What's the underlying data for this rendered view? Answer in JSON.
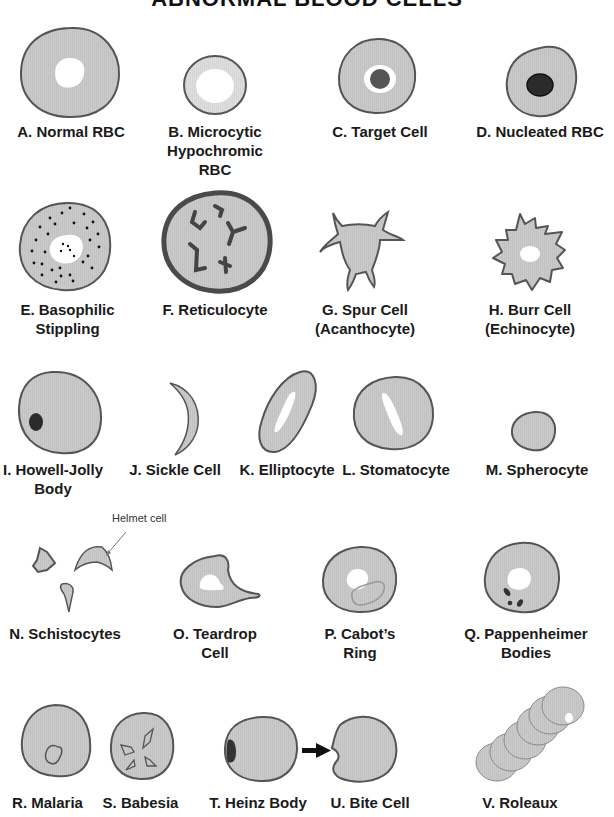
{
  "title": "ABNORMAL BLOOD CELLS",
  "colors": {
    "cell_fill": "#c9c9c9",
    "cell_outline": "#555555",
    "pale_center": "#ffffff",
    "inclusion_dark": "#333333",
    "microcytic_fill": "#dcdcdc",
    "reticulocyte_outline": "#4a4a4a"
  },
  "cells": [
    {
      "id": "A",
      "label_lines": [
        "A. Normal RBC"
      ]
    },
    {
      "id": "B",
      "label_lines": [
        "B. Microcytic",
        "Hypochromic",
        "RBC"
      ]
    },
    {
      "id": "C",
      "label_lines": [
        "C. Target Cell"
      ]
    },
    {
      "id": "D",
      "label_lines": [
        "D. Nucleated RBC"
      ]
    },
    {
      "id": "E",
      "label_lines": [
        "E. Basophilic",
        "Stippling"
      ]
    },
    {
      "id": "F",
      "label_lines": [
        "F. Reticulocyte"
      ]
    },
    {
      "id": "G",
      "label_lines": [
        "G. Spur Cell",
        "(Acanthocyte)"
      ]
    },
    {
      "id": "H",
      "label_lines": [
        "H. Burr Cell",
        "(Echinocyte)"
      ]
    },
    {
      "id": "I",
      "label_lines": [
        "I. Howell-Jolly",
        "Body"
      ]
    },
    {
      "id": "J",
      "label_lines": [
        "J. Sickle Cell"
      ]
    },
    {
      "id": "K",
      "label_lines": [
        "K. Elliptocyte"
      ]
    },
    {
      "id": "L",
      "label_lines": [
        "L. Stomatocyte"
      ]
    },
    {
      "id": "M",
      "label_lines": [
        "M. Spherocyte"
      ]
    },
    {
      "id": "N",
      "label_lines": [
        "N. Schistocytes"
      ]
    },
    {
      "id": "O",
      "label_lines": [
        "O. Teardrop",
        "Cell"
      ]
    },
    {
      "id": "P",
      "label_lines": [
        "P. Cabot’s",
        "Ring"
      ]
    },
    {
      "id": "Q",
      "label_lines": [
        "Q. Pappenheimer",
        "Bodies"
      ]
    },
    {
      "id": "R",
      "label_lines": [
        "R. Malaria"
      ]
    },
    {
      "id": "S",
      "label_lines": [
        "S. Babesia"
      ]
    },
    {
      "id": "T",
      "label_lines": [
        "T. Heinz Body"
      ]
    },
    {
      "id": "U",
      "label_lines": [
        "U. Bite Cell"
      ]
    },
    {
      "id": "V",
      "label_lines": [
        "V. Roleaux"
      ]
    }
  ],
  "annotations": {
    "helmet_cell": "Helmet cell"
  }
}
